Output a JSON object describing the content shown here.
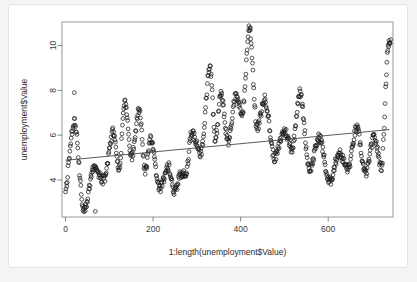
{
  "page": {
    "background_color": "#f4f4f4",
    "card_background": "#ffffff",
    "card_border_color": "#e3e3e3",
    "ghost_text": ""
  },
  "chart_data": {
    "type": "scatter",
    "title": "",
    "xlabel": "1:length(unemployment$Value)",
    "ylabel": "unemployment$Value",
    "xlim": [
      -8,
      748
    ],
    "ylim": [
      2.35,
      11.05
    ],
    "xticks": [
      0,
      200,
      400,
      600
    ],
    "yticks": [
      4,
      6,
      8,
      10
    ],
    "xtick_labels": [
      "0",
      "200",
      "400",
      "600"
    ],
    "ytick_labels": [
      "4",
      "6",
      "8",
      "10"
    ],
    "grid": false,
    "legend": null,
    "marker": {
      "shape": "open-circle",
      "radius": 1.9,
      "stroke_color": "#1d1d1d",
      "stroke_width": 0.75,
      "fill": "none"
    },
    "trend_line": {
      "type": "linear-fit",
      "color": "#3d3d3d",
      "x_start": 0,
      "y_start": 4.88,
      "x_end": 740,
      "y_end": 6.25
    },
    "frame": {
      "color": "#8d8d8d",
      "box": true
    },
    "n_points": 744,
    "series": [
      {
        "name": "unemployment$Value",
        "description": "Monthly unemployment rate index, seasonal oscillation with rising trend",
        "x": [
          0,
          740
        ],
        "seasonal_cycles": [
          {
            "x_center": 20,
            "peak": 6.6,
            "trough": 3.5
          },
          {
            "x_center": 65,
            "peak": 4.5,
            "trough": 2.6
          },
          {
            "x_center": 110,
            "peak": 6.2,
            "trough": 4.0
          },
          {
            "x_center": 135,
            "peak": 7.4,
            "trough": 4.5
          },
          {
            "x_center": 168,
            "peak": 7.2,
            "trough": 5.0
          },
          {
            "x_center": 195,
            "peak": 5.9,
            "trough": 4.4
          },
          {
            "x_center": 235,
            "peak": 4.6,
            "trough": 3.6
          },
          {
            "x_center": 262,
            "peak": 4.2,
            "trough": 3.4
          },
          {
            "x_center": 288,
            "peak": 6.1,
            "trough": 4.3
          },
          {
            "x_center": 330,
            "peak": 9.0,
            "trough": 5.2
          },
          {
            "x_center": 355,
            "peak": 7.8,
            "trough": 5.8
          },
          {
            "x_center": 388,
            "peak": 7.7,
            "trough": 5.7
          },
          {
            "x_center": 420,
            "peak": 10.8,
            "trough": 7.0
          },
          {
            "x_center": 455,
            "peak": 7.6,
            "trough": 6.3
          },
          {
            "x_center": 500,
            "peak": 6.2,
            "trough": 5.0
          },
          {
            "x_center": 535,
            "peak": 7.9,
            "trough": 5.4
          },
          {
            "x_center": 580,
            "peak": 5.9,
            "trough": 4.5
          },
          {
            "x_center": 625,
            "peak": 5.2,
            "trough": 3.9
          },
          {
            "x_center": 665,
            "peak": 6.3,
            "trough": 4.5
          },
          {
            "x_center": 705,
            "peak": 5.9,
            "trough": 4.3
          },
          {
            "x_center": 738,
            "peak": 10.1,
            "trough": 4.6
          }
        ],
        "notable_points": [
          {
            "x": 20,
            "y": 7.9,
            "note": "isolated high outlier, left region"
          },
          {
            "x": 422,
            "y": 10.8,
            "note": "global maximum spike"
          },
          {
            "x": 68,
            "y": 2.6,
            "note": "global minimum"
          },
          {
            "x": 739,
            "y": 10.1,
            "note": "right-edge vertical rise"
          }
        ]
      }
    ]
  }
}
